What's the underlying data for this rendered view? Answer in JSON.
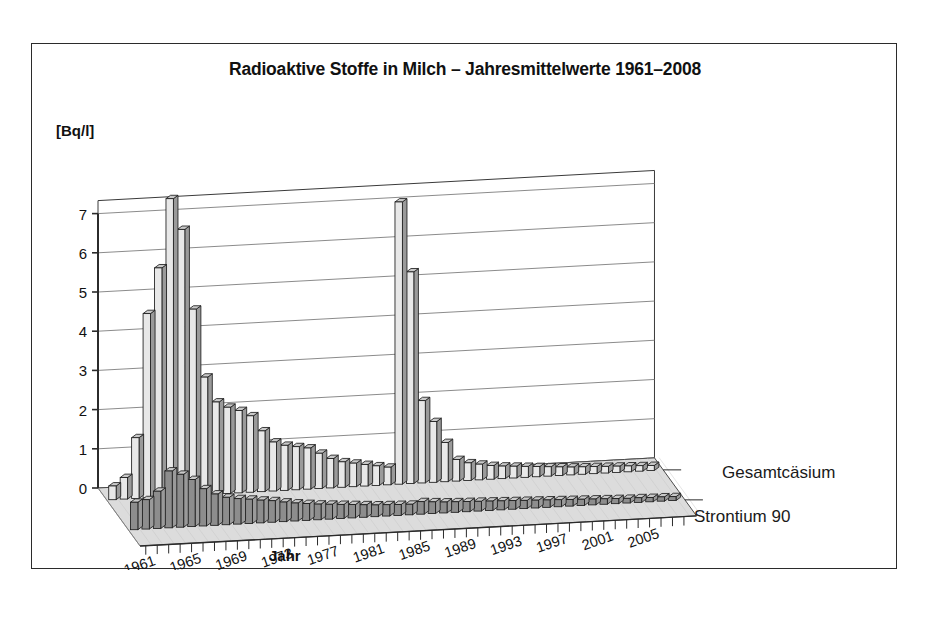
{
  "figure": {
    "title": "Radioaktive Stoffe in Milch – Jahresmittelwerte 1961–2008",
    "y_axis_unit": "[Bq/l]",
    "x_axis_title": "Jahr",
    "series_label_back": "Gesamtcäsium",
    "series_label_front": "Strontium 90",
    "frame_color": "#2b2b2b",
    "floor_color": "#dcdcdc",
    "bar_color_back": "#e8e8e8",
    "bar_color_front": "#8d8d8d"
  },
  "chart_data": {
    "type": "bar",
    "title": "Radioaktive Stoffe in Milch – Jahresmittelwerte 1961–2008",
    "xlabel": "Jahr",
    "ylabel": "[Bq/l]",
    "ylim": [
      0,
      7
    ],
    "yticks": [
      0,
      1,
      2,
      3,
      4,
      5,
      6,
      7
    ],
    "grid": true,
    "legend_position": "right-inline",
    "projection": "3d-two-row",
    "categories": [
      "1961",
      "1962",
      "1963",
      "1964",
      "1965",
      "1966",
      "1967",
      "1968",
      "1969",
      "1970",
      "1971",
      "1972",
      "1973",
      "1974",
      "1975",
      "1976",
      "1977",
      "1978",
      "1979",
      "1980",
      "1981",
      "1982",
      "1983",
      "1984",
      "1985",
      "1986",
      "1987",
      "1988",
      "1989",
      "1990",
      "1991",
      "1992",
      "1993",
      "1994",
      "1995",
      "1996",
      "1997",
      "1998",
      "1999",
      "2000",
      "2001",
      "2002",
      "2003",
      "2004",
      "2005",
      "2006",
      "2007",
      "2008"
    ],
    "xtick_labels": [
      "1961",
      "1965",
      "1969",
      "1973",
      "1977",
      "1981",
      "1985",
      "1989",
      "1993",
      "1997",
      "2001",
      "2005"
    ],
    "xtick_every": 4,
    "series": [
      {
        "name": "Gesamtcäsium",
        "values": [
          0.35,
          0.55,
          1.55,
          4.7,
          5.85,
          7.6,
          6.8,
          4.75,
          3.0,
          2.35,
          2.2,
          2.1,
          1.95,
          1.55,
          1.25,
          1.15,
          1.1,
          1.05,
          0.9,
          0.75,
          0.65,
          0.6,
          0.55,
          0.5,
          0.45,
          7.2,
          5.4,
          2.1,
          1.55,
          1.0,
          0.55,
          0.45,
          0.4,
          0.35,
          0.32,
          0.3,
          0.28,
          0.26,
          0.24,
          0.22,
          0.2,
          0.19,
          0.18,
          0.17,
          0.16,
          0.15,
          0.14,
          0.13
        ]
      },
      {
        "name": "Strontium 90",
        "values": [
          0.7,
          0.75,
          0.95,
          1.45,
          1.35,
          1.2,
          0.95,
          0.8,
          0.7,
          0.65,
          0.62,
          0.58,
          0.55,
          0.5,
          0.46,
          0.43,
          0.4,
          0.38,
          0.36,
          0.34,
          0.32,
          0.3,
          0.29,
          0.28,
          0.27,
          0.32,
          0.3,
          0.28,
          0.27,
          0.26,
          0.25,
          0.24,
          0.23,
          0.22,
          0.21,
          0.2,
          0.19,
          0.18,
          0.17,
          0.16,
          0.15,
          0.14,
          0.13,
          0.12,
          0.12,
          0.11,
          0.11,
          0.1
        ]
      }
    ]
  }
}
